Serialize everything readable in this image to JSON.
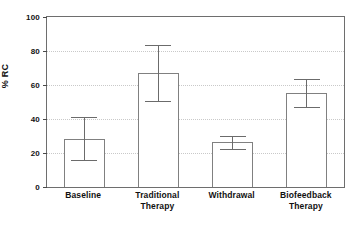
{
  "chart_data": {
    "type": "bar",
    "title": "",
    "subtitle": "",
    "xlabel": "",
    "ylabel": "% RC",
    "ylim": [
      0,
      100
    ],
    "yticks": [
      0,
      20,
      40,
      60,
      80,
      100
    ],
    "ytick_labels": [
      "0",
      "20",
      "40",
      "60",
      "80",
      "100"
    ],
    "grid": true,
    "grid_axis": "y",
    "legend": false,
    "legend_position": "none",
    "orientation": "vertical",
    "bar_fill": "#ffffff",
    "bar_edge_color": "#808080",
    "error_bar_color": "#6b6b6b",
    "categories": [
      "Baseline",
      "Traditional Therapy",
      "Withdrawal",
      "Biofeedback Therapy"
    ],
    "category_lines": [
      [
        "Baseline"
      ],
      [
        "Traditional",
        "Therapy"
      ],
      [
        "Withdrawal"
      ],
      [
        "Biofeedback",
        "Therapy"
      ]
    ],
    "values": [
      28.5,
      67,
      26.5,
      55.5
    ],
    "error_low": [
      16,
      50.5,
      22.5,
      47
    ],
    "error_high": [
      41,
      83.5,
      30,
      63.5
    ],
    "series": [
      {
        "name": "% RC",
        "values": [
          28.5,
          67,
          26.5,
          55.5
        ],
        "error_low": [
          16,
          50.5,
          22.5,
          47
        ],
        "error_high": [
          41,
          83.5,
          30,
          63.5
        ]
      }
    ],
    "annotations": []
  },
  "axis": {
    "y_title": "% RC"
  }
}
